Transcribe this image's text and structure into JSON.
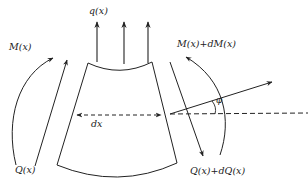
{
  "diagram": {
    "type": "beam element free-body diagram",
    "labels": {
      "q": "q(x)",
      "moment_left": "M(x)",
      "moment_right": "M(x)+dM(x)",
      "shear_left": "Q(x)",
      "shear_right": "Q(x)+dQ(x)",
      "length": "dx",
      "angle": "φ"
    },
    "colors": {
      "stroke": "#222222",
      "background": "#ffffff"
    }
  }
}
